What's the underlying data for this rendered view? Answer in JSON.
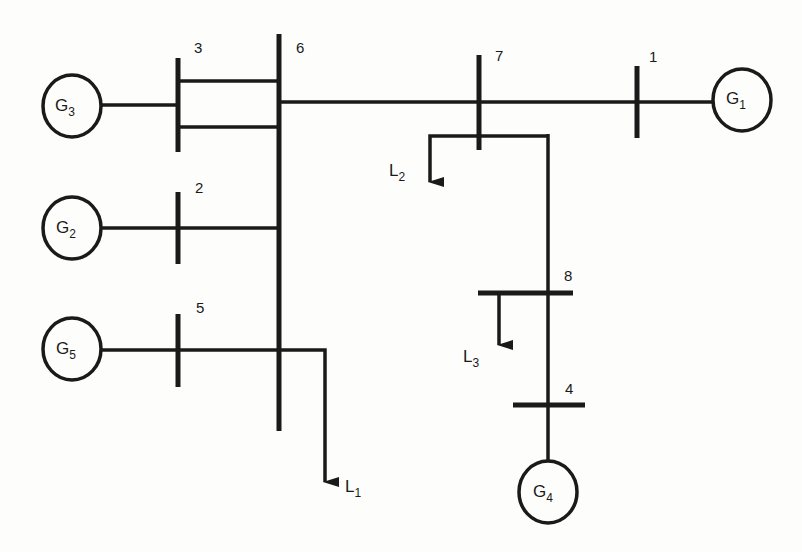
{
  "diagram": {
    "type": "single-line power system diagram",
    "colors": {
      "line": "#1a1a1a",
      "background": "#fdfdfb"
    },
    "buses": [
      {
        "id": "1",
        "label": "1"
      },
      {
        "id": "2",
        "label": "2"
      },
      {
        "id": "3",
        "label": "3"
      },
      {
        "id": "4",
        "label": "4"
      },
      {
        "id": "5",
        "label": "5"
      },
      {
        "id": "6",
        "label": "6"
      },
      {
        "id": "7",
        "label": "7"
      },
      {
        "id": "8",
        "label": "8"
      }
    ],
    "generators": [
      {
        "id": "G1",
        "base": "G",
        "sub": "1",
        "bus": "1"
      },
      {
        "id": "G2",
        "base": "G",
        "sub": "2",
        "bus": "2"
      },
      {
        "id": "G3",
        "base": "G",
        "sub": "3",
        "bus": "3"
      },
      {
        "id": "G4",
        "base": "G",
        "sub": "4",
        "bus": "4"
      },
      {
        "id": "G5",
        "base": "G",
        "sub": "5",
        "bus": "5"
      }
    ],
    "loads": [
      {
        "id": "L1",
        "base": "L",
        "sub": "1",
        "bus": "6"
      },
      {
        "id": "L2",
        "base": "L",
        "sub": "2",
        "bus": "7"
      },
      {
        "id": "L3",
        "base": "L",
        "sub": "3",
        "bus": "8"
      }
    ],
    "lines": [
      {
        "from": "3",
        "to": "6",
        "count": 2
      },
      {
        "from": "2",
        "to": "6"
      },
      {
        "from": "5",
        "to": "6"
      },
      {
        "from": "6",
        "to": "7"
      },
      {
        "from": "7",
        "to": "1"
      },
      {
        "from": "7",
        "to": "8"
      },
      {
        "from": "8",
        "to": "4"
      }
    ]
  }
}
